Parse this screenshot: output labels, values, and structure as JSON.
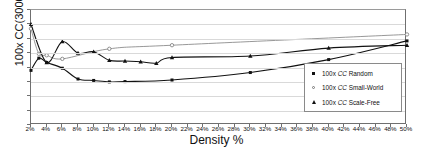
{
  "chart_data": {
    "type": "line",
    "title": "",
    "xlabel": "Density %",
    "ylabel": "100x CC(3000)",
    "xlim": [
      2,
      50
    ],
    "ylim": [
      0,
      80
    ],
    "grid": true,
    "legend_position": "bottom-right",
    "yticks": [
      0,
      10,
      20,
      30,
      40,
      50,
      60,
      70,
      80
    ],
    "ytick_labels": [
      "0",
      "10",
      "20",
      "30",
      "40",
      "50",
      "60",
      "70",
      "80"
    ],
    "xticks": [
      2,
      4,
      6,
      8,
      10,
      12,
      14,
      16,
      18,
      20,
      22,
      24,
      26,
      28,
      30,
      32,
      34,
      36,
      38,
      40,
      42,
      44,
      46,
      48,
      50
    ],
    "xtick_labels": [
      "2%",
      "4%",
      "6%",
      "8%",
      "10%",
      "12%",
      "14%",
      "16%",
      "18%",
      "20%",
      "22%",
      "24%",
      "26%",
      "28%",
      "30%",
      "32%",
      "34%",
      "36%",
      "38%",
      "40%",
      "42%",
      "44%",
      "46%",
      "48%",
      "50%"
    ],
    "series": [
      {
        "name": "100x CC Random",
        "marker": "filled-square",
        "color": "#111111",
        "points": [
          {
            "x": 2,
            "y": 38.0
          },
          {
            "x": 3,
            "y": 46.5
          },
          {
            "x": 4,
            "y": 43.5
          },
          {
            "x": 6,
            "y": 39.5
          },
          {
            "x": 8,
            "y": 32.0
          },
          {
            "x": 10,
            "y": 31.0
          },
          {
            "x": 12,
            "y": 30.0
          },
          {
            "x": 14,
            "y": 30.2
          },
          {
            "x": 20,
            "y": 31.3
          },
          {
            "x": 30,
            "y": 36.5
          },
          {
            "x": 40,
            "y": 45.5
          },
          {
            "x": 50,
            "y": 58.5
          }
        ]
      },
      {
        "name": "100x CC Small-World",
        "marker": "open-circle",
        "color": "#8c8c8c",
        "points": [
          {
            "x": 2,
            "y": 67.0
          },
          {
            "x": 3,
            "y": 49.5
          },
          {
            "x": 4,
            "y": 48.5
          },
          {
            "x": 6,
            "y": 46.0
          },
          {
            "x": 12,
            "y": 53.0
          },
          {
            "x": 20,
            "y": 55.5
          },
          {
            "x": 50,
            "y": 63.0
          }
        ]
      },
      {
        "name": "100x CC Scale-Free",
        "marker": "filled-triangle",
        "color": "#111111",
        "points": [
          {
            "x": 2,
            "y": 70.0
          },
          {
            "x": 4,
            "y": 43.5
          },
          {
            "x": 6,
            "y": 58.0
          },
          {
            "x": 8,
            "y": 50.0
          },
          {
            "x": 10,
            "y": 51.0
          },
          {
            "x": 12,
            "y": 45.0
          },
          {
            "x": 14,
            "y": 44.5
          },
          {
            "x": 16,
            "y": 44.0
          },
          {
            "x": 18,
            "y": 43.0
          },
          {
            "x": 20,
            "y": 47.0
          },
          {
            "x": 30,
            "y": 48.0
          },
          {
            "x": 40,
            "y": 53.5
          },
          {
            "x": 50,
            "y": 55.5
          }
        ]
      }
    ]
  },
  "legend": {
    "items": [
      {
        "label_prefix": "100x ",
        "label_em": "CC",
        "label_suffix": " Random",
        "key": "filled-square"
      },
      {
        "label_prefix": "100x ",
        "label_em": "CC",
        "label_suffix": " Small-World",
        "key": "open-circle"
      },
      {
        "label_prefix": "100x ",
        "label_em": "CC",
        "label_suffix": " Scale-Free",
        "key": "filled-triangle"
      }
    ]
  }
}
